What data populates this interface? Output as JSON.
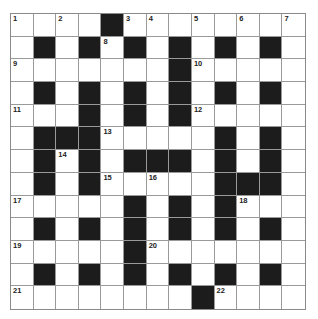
{
  "puzzle": {
    "rows": 13,
    "cols": 13,
    "colors": {
      "block": "#1c1c1c",
      "cell": "#ffffff",
      "line": "#9a9a9a"
    },
    "grid": [
      "####.########",
      "#.#.#.#.#.#.#",
      "#######.#####",
      "#.#.#.#.#.#.#",
      "###.#.#.#####",
      "#...#####.#.#",
      "#.#.#...#.#.#",
      "#.#.#####...#",
      "#####.#.#.###",
      "#.#.#.#.#.#.#",
      "#####.#######",
      "#.#.#.#.#.#.#",
      "########.####"
    ],
    "numbers": [
      {
        "r": 0,
        "c": 0,
        "n": "1"
      },
      {
        "r": 0,
        "c": 2,
        "n": "2"
      },
      {
        "r": 0,
        "c": 5,
        "n": "3"
      },
      {
        "r": 0,
        "c": 6,
        "n": "4"
      },
      {
        "r": 0,
        "c": 8,
        "n": "5"
      },
      {
        "r": 0,
        "c": 10,
        "n": "6"
      },
      {
        "r": 0,
        "c": 12,
        "n": "7"
      },
      {
        "r": 1,
        "c": 4,
        "n": "8"
      },
      {
        "r": 2,
        "c": 0,
        "n": "9"
      },
      {
        "r": 2,
        "c": 8,
        "n": "10"
      },
      {
        "r": 4,
        "c": 0,
        "n": "11"
      },
      {
        "r": 4,
        "c": 8,
        "n": "12"
      },
      {
        "r": 5,
        "c": 4,
        "n": "13"
      },
      {
        "r": 6,
        "c": 2,
        "n": "14"
      },
      {
        "r": 7,
        "c": 4,
        "n": "15"
      },
      {
        "r": 7,
        "c": 6,
        "n": "16"
      },
      {
        "r": 8,
        "c": 0,
        "n": "17"
      },
      {
        "r": 8,
        "c": 10,
        "n": "18"
      },
      {
        "r": 10,
        "c": 0,
        "n": "19"
      },
      {
        "r": 10,
        "c": 6,
        "n": "20"
      },
      {
        "r": 12,
        "c": 0,
        "n": "21"
      },
      {
        "r": 12,
        "c": 9,
        "n": "22"
      }
    ]
  }
}
